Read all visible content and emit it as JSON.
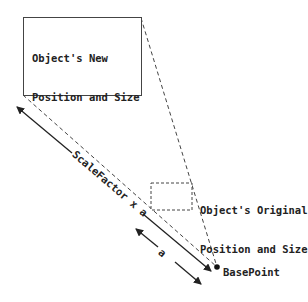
{
  "diagram": {
    "new_object": {
      "label_line1": "Object's New",
      "label_line2": "Position and Size"
    },
    "original_object": {
      "label_line1": "Object's Original",
      "label_line2": "Position and Size"
    },
    "base_point": {
      "label": "BasePoint"
    },
    "long_arrow": {
      "label": "ScaleFactor x a"
    },
    "short_arrow": {
      "label": "a"
    },
    "colors": {
      "line": "#333333",
      "text": "#222222",
      "background": "#ffffff"
    }
  }
}
